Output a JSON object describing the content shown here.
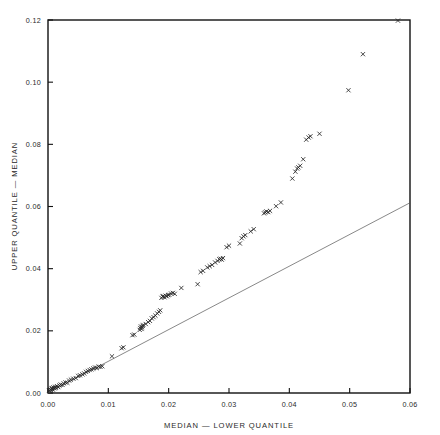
{
  "chart_data": {
    "type": "scatter",
    "title": "",
    "xlabel": "MEDIAN — LOWER QUANTILE",
    "ylabel": "UPPER QUANTILE — MEDIAN",
    "xlim": [
      0.0,
      0.06
    ],
    "ylim": [
      0.0,
      0.12
    ],
    "xticks": [
      0.0,
      0.01,
      0.02,
      0.03,
      0.04,
      0.05,
      0.06
    ],
    "xtick_labels": [
      "0.00",
      "0.01",
      "0.02",
      "0.03",
      "0.04",
      "0.05",
      "0.06"
    ],
    "yticks": [
      0.0,
      0.02,
      0.04,
      0.06,
      0.08,
      0.1,
      0.12
    ],
    "ytick_labels": [
      "0.00",
      "0.02",
      "0.04",
      "0.06",
      "0.08",
      "0.10",
      "0.12"
    ],
    "grid": false,
    "legend": null,
    "marker": "x",
    "marker_color": "#262626",
    "marker_size": 3.0,
    "reference_line": {
      "name": "identity-reference-line",
      "x0": 0.0,
      "y0": 0.0,
      "x1": 0.06,
      "y1": 0.0612,
      "color": "#555555"
    },
    "series": [
      {
        "name": "quantile-spread",
        "points": [
          [
            0.0002,
            0.0008
          ],
          [
            0.0004,
            0.0012
          ],
          [
            0.0005,
            0.0009
          ],
          [
            0.0006,
            0.0014
          ],
          [
            0.0007,
            0.0016
          ],
          [
            0.0008,
            0.0011
          ],
          [
            0.0009,
            0.0018
          ],
          [
            0.0011,
            0.0015
          ],
          [
            0.0012,
            0.002
          ],
          [
            0.0013,
            0.0017
          ],
          [
            0.0015,
            0.0022
          ],
          [
            0.0017,
            0.0019
          ],
          [
            0.0019,
            0.0024
          ],
          [
            0.0021,
            0.0027
          ],
          [
            0.0024,
            0.0026
          ],
          [
            0.0026,
            0.0031
          ],
          [
            0.0029,
            0.0034
          ],
          [
            0.0032,
            0.0033
          ],
          [
            0.0035,
            0.004
          ],
          [
            0.0038,
            0.0043
          ],
          [
            0.0042,
            0.0046
          ],
          [
            0.0046,
            0.0048
          ],
          [
            0.005,
            0.0055
          ],
          [
            0.0053,
            0.0057
          ],
          [
            0.0057,
            0.006
          ],
          [
            0.006,
            0.0063
          ],
          [
            0.0063,
            0.0068
          ],
          [
            0.0066,
            0.0071
          ],
          [
            0.0069,
            0.0074
          ],
          [
            0.0072,
            0.0076
          ],
          [
            0.0075,
            0.0079
          ],
          [
            0.0078,
            0.0082
          ],
          [
            0.0081,
            0.008
          ],
          [
            0.0084,
            0.0085
          ],
          [
            0.0087,
            0.0084
          ],
          [
            0.009,
            0.0086
          ],
          [
            0.0106,
            0.0118
          ],
          [
            0.0122,
            0.0144
          ],
          [
            0.0125,
            0.0147
          ],
          [
            0.014,
            0.0186
          ],
          [
            0.0143,
            0.0188
          ],
          [
            0.0152,
            0.0203
          ],
          [
            0.0153,
            0.0209
          ],
          [
            0.0154,
            0.0214
          ],
          [
            0.0155,
            0.0206
          ],
          [
            0.0156,
            0.0211
          ],
          [
            0.0157,
            0.0216
          ],
          [
            0.0158,
            0.0219
          ],
          [
            0.0162,
            0.0222
          ],
          [
            0.0166,
            0.0228
          ],
          [
            0.0169,
            0.0232
          ],
          [
            0.0172,
            0.024
          ],
          [
            0.0175,
            0.0244
          ],
          [
            0.0178,
            0.0249
          ],
          [
            0.0181,
            0.0256
          ],
          [
            0.0184,
            0.0261
          ],
          [
            0.0186,
            0.0266
          ],
          [
            0.0188,
            0.0306
          ],
          [
            0.019,
            0.031
          ],
          [
            0.0191,
            0.0312
          ],
          [
            0.0193,
            0.0308
          ],
          [
            0.0195,
            0.0313
          ],
          [
            0.0197,
            0.0311
          ],
          [
            0.0199,
            0.0315
          ],
          [
            0.0201,
            0.0316
          ],
          [
            0.0204,
            0.032
          ],
          [
            0.0207,
            0.0322
          ],
          [
            0.021,
            0.0319
          ],
          [
            0.0221,
            0.0338
          ],
          [
            0.0248,
            0.035
          ],
          [
            0.0253,
            0.0389
          ],
          [
            0.0257,
            0.0393
          ],
          [
            0.0264,
            0.0404
          ],
          [
            0.0268,
            0.0408
          ],
          [
            0.0272,
            0.0412
          ],
          [
            0.0277,
            0.042
          ],
          [
            0.0281,
            0.0425
          ],
          [
            0.0284,
            0.043
          ],
          [
            0.0286,
            0.0432
          ],
          [
            0.0288,
            0.0429
          ],
          [
            0.029,
            0.0434
          ],
          [
            0.0296,
            0.0469
          ],
          [
            0.03,
            0.0474
          ],
          [
            0.0318,
            0.0481
          ],
          [
            0.0321,
            0.0498
          ],
          [
            0.0324,
            0.0504
          ],
          [
            0.0327,
            0.0508
          ],
          [
            0.0336,
            0.052
          ],
          [
            0.0341,
            0.0527
          ],
          [
            0.0358,
            0.0578
          ],
          [
            0.036,
            0.0581
          ],
          [
            0.0362,
            0.0584
          ],
          [
            0.0365,
            0.0582
          ],
          [
            0.0368,
            0.0586
          ],
          [
            0.0378,
            0.0601
          ],
          [
            0.0386,
            0.0613
          ],
          [
            0.0405,
            0.069
          ],
          [
            0.041,
            0.0712
          ],
          [
            0.0413,
            0.0722
          ],
          [
            0.0415,
            0.0726
          ],
          [
            0.0418,
            0.0731
          ],
          [
            0.0423,
            0.0752
          ],
          [
            0.0428,
            0.0815
          ],
          [
            0.0432,
            0.0822
          ],
          [
            0.0435,
            0.0826
          ],
          [
            0.045,
            0.0834
          ],
          [
            0.0498,
            0.0974
          ],
          [
            0.0522,
            0.109
          ],
          [
            0.058,
            0.1198
          ]
        ]
      }
    ]
  },
  "axes": {
    "x_title": "MEDIAN — LOWER QUANTILE",
    "y_title": "UPPER QUANTILE — MEDIAN"
  }
}
